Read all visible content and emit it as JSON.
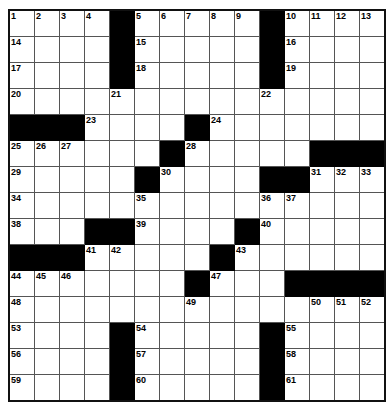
{
  "puzzle": {
    "type": "crossword-grid",
    "rows": 15,
    "columns": 15,
    "cell_size_px": 25,
    "colors": {
      "fill": "#ffffff",
      "block": "#000000",
      "gridline": "#555555",
      "border": "#111111",
      "number": "#000000"
    },
    "grid": [
      [
        "1",
        "2",
        "3",
        "4",
        "#",
        "5",
        "6",
        "7",
        "8",
        "9",
        "#",
        "10",
        "11",
        "12",
        "13"
      ],
      [
        "14",
        "",
        "",
        "",
        "#",
        "15",
        "",
        "",
        "",
        "",
        "#",
        "16",
        "",
        "",
        ""
      ],
      [
        "17",
        "",
        "",
        "",
        "#",
        "18",
        "",
        "",
        "",
        "",
        "#",
        "19",
        "",
        "",
        ""
      ],
      [
        "20",
        "",
        "",
        "",
        "21",
        "",
        "",
        "",
        "",
        "",
        "22",
        "",
        "",
        "",
        ""
      ],
      [
        "#",
        "#",
        "#",
        "23",
        "",
        "",
        "",
        "#",
        "24",
        "",
        "",
        "",
        "",
        "",
        ""
      ],
      [
        "25",
        "26",
        "27",
        "",
        "",
        "",
        "#",
        "28",
        "",
        "",
        "",
        "",
        "#",
        "#",
        "#"
      ],
      [
        "29",
        "",
        "",
        "",
        "",
        "#",
        "30",
        "",
        "",
        "",
        "#",
        "#",
        "31",
        "32",
        "33"
      ],
      [
        "34",
        "",
        "",
        "",
        "",
        "35",
        "",
        "",
        "",
        "",
        "36",
        "37",
        "",
        "",
        ""
      ],
      [
        "38",
        "",
        "",
        "#",
        "#",
        "39",
        "",
        "",
        "",
        "#",
        "40",
        "",
        "",
        "",
        ""
      ],
      [
        "#",
        "#",
        "#",
        "41",
        "42",
        "",
        "",
        "",
        "#",
        "43",
        "",
        "",
        "",
        "",
        ""
      ],
      [
        "44",
        "45",
        "46",
        "",
        "",
        "",
        "",
        "#",
        "47",
        "",
        "",
        "#",
        "#",
        "#",
        "#"
      ],
      [
        "48",
        "",
        "",
        "",
        "",
        "",
        "",
        "49",
        "",
        "",
        "",
        "",
        "50",
        "51",
        "52"
      ],
      [
        "53",
        "",
        "",
        "",
        "#",
        "54",
        "",
        "",
        "",
        "",
        "#",
        "55",
        "",
        "",
        ""
      ],
      [
        "56",
        "",
        "",
        "",
        "#",
        "57",
        "",
        "",
        "",
        "",
        "#",
        "58",
        "",
        "",
        ""
      ],
      [
        "59",
        "",
        "",
        "",
        "#",
        "60",
        "",
        "",
        "",
        "",
        "#",
        "61",
        "",
        "",
        ""
      ]
    ]
  }
}
